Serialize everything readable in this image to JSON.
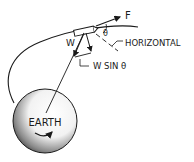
{
  "diagram": {
    "labels": {
      "force": "F",
      "angle": "θ",
      "horizontal": "HORIZONTAL",
      "weight": "W",
      "weight_component": "W SIN θ",
      "earth": "EARTH"
    },
    "colors": {
      "ink": "#1a1a1a",
      "background": "#ffffff",
      "earth_shade": "#555555"
    }
  }
}
